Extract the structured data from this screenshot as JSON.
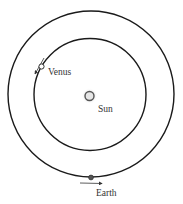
{
  "diagram": {
    "bodies": [
      {
        "id": "sun",
        "label": "Sun"
      },
      {
        "id": "venus",
        "label": "Venus"
      },
      {
        "id": "earth",
        "label": "Earth"
      }
    ],
    "orbits": [
      {
        "id": "venus-orbit",
        "body": "venus"
      },
      {
        "id": "earth-orbit",
        "body": "earth"
      }
    ],
    "colors": {
      "orbit": "#1a1a1a",
      "sun_fill": "#d9d9d9",
      "sun_glow": "#bfbfbf",
      "venus_fill": "#ffffff",
      "earth_fill": "#555555",
      "arrow": "#333333",
      "text": "#333333"
    }
  }
}
